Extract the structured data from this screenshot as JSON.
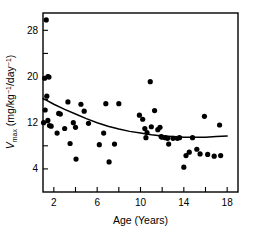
{
  "chart_data": {
    "type": "scatter",
    "title": "",
    "xlabel": "Age (Years)",
    "ylabel": "Vmax (mg/kg-1/day-1)",
    "ylabel_parts": {
      "symbol": "V",
      "subscript": "max",
      "unit_open": " (mg/kg",
      "sup1": "−1",
      "mid": "/day",
      "sup2": "−1",
      "unit_close": ")"
    },
    "xlim": [
      1,
      19
    ],
    "ylim": [
      0,
      31
    ],
    "xticks": [
      2,
      4,
      6,
      8,
      10,
      12,
      14,
      16,
      18
    ],
    "xticklabels": [
      "2",
      "",
      "6",
      "",
      "10",
      "",
      "14",
      "",
      "18"
    ],
    "yticks": [
      4,
      8,
      12,
      16,
      20,
      24,
      28
    ],
    "yticklabels": [
      "4",
      "",
      "12",
      "",
      "20",
      "",
      "28"
    ],
    "grid": false,
    "legend": false,
    "marker": "filled-circle",
    "marker_color": "#000000",
    "marker_radius_px": 2.6,
    "points": [
      [
        1.3,
        29.8
      ],
      [
        1.15,
        19.7
      ],
      [
        1.45,
        20.0
      ],
      [
        1.55,
        19.9
      ],
      [
        1.35,
        16.6
      ],
      [
        1.2,
        14.2
      ],
      [
        1.05,
        12.0
      ],
      [
        1.45,
        12.4
      ],
      [
        1.6,
        11.5
      ],
      [
        1.75,
        11.4
      ],
      [
        2.3,
        10.2
      ],
      [
        2.45,
        13.6
      ],
      [
        2.6,
        13.5
      ],
      [
        3.0,
        11.0
      ],
      [
        3.3,
        15.6
      ],
      [
        3.5,
        8.4
      ],
      [
        3.8,
        12.0
      ],
      [
        4.0,
        11.2
      ],
      [
        4.05,
        5.7
      ],
      [
        4.5,
        15.2
      ],
      [
        4.8,
        14.0
      ],
      [
        5.2,
        11.9
      ],
      [
        6.2,
        8.2
      ],
      [
        6.6,
        10.2
      ],
      [
        6.8,
        15.3
      ],
      [
        7.1,
        5.2
      ],
      [
        7.6,
        8.3
      ],
      [
        8.0,
        15.3
      ],
      [
        9.9,
        13.3
      ],
      [
        10.2,
        12.6
      ],
      [
        10.4,
        11.0
      ],
      [
        10.6,
        10.3
      ],
      [
        10.5,
        9.4
      ],
      [
        10.9,
        19.1
      ],
      [
        11.0,
        11.3
      ],
      [
        11.3,
        14.1
      ],
      [
        11.6,
        10.8
      ],
      [
        11.8,
        11.2
      ],
      [
        11.9,
        9.6
      ],
      [
        12.0,
        9.5
      ],
      [
        12.3,
        9.4
      ],
      [
        12.5,
        9.3
      ],
      [
        12.6,
        8.3
      ],
      [
        13.0,
        9.3
      ],
      [
        13.4,
        9.3
      ],
      [
        13.6,
        9.4
      ],
      [
        14.0,
        4.3
      ],
      [
        14.2,
        6.3
      ],
      [
        14.5,
        6.9
      ],
      [
        14.8,
        9.4
      ],
      [
        15.2,
        7.4
      ],
      [
        15.5,
        6.6
      ],
      [
        15.9,
        13.1
      ],
      [
        16.2,
        6.5
      ],
      [
        16.8,
        6.2
      ],
      [
        17.3,
        11.6
      ],
      [
        17.4,
        6.3
      ]
    ],
    "trend": {
      "name": "fitted-curve",
      "color": "#000000",
      "x": [
        1.0,
        2.0,
        3.0,
        4.0,
        5.0,
        6.0,
        7.0,
        8.0,
        9.0,
        10.0,
        11.0,
        12.0,
        13.0,
        14.0,
        15.0,
        16.0,
        17.0,
        18.0
      ],
      "y": [
        16.2,
        15.2,
        14.3,
        13.5,
        12.7,
        12.0,
        11.4,
        10.9,
        10.5,
        10.2,
        9.9,
        9.7,
        9.6,
        9.5,
        9.5,
        9.5,
        9.6,
        9.7
      ]
    }
  }
}
